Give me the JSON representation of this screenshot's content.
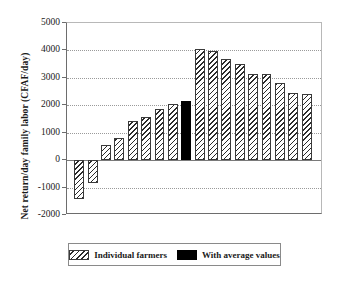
{
  "chart_data": {
    "type": "bar",
    "title": "",
    "xlabel": "",
    "ylabel": "Net return/day family labor (CFAF/day)",
    "ylim": [
      -2000,
      5000
    ],
    "yticks": [
      5000,
      4000,
      3000,
      2000,
      1000,
      0,
      -1000,
      -2000
    ],
    "ytick_labels": [
      "5000",
      "4000",
      "3000",
      "2000",
      "1000",
      "0",
      "-1000",
      "-2000"
    ],
    "grid": true,
    "grid_axis": "y",
    "legend_position": "bottom",
    "categories": [
      "1",
      "2",
      "3",
      "4",
      "5",
      "6",
      "7",
      "8",
      "9",
      "10",
      "11",
      "12",
      "13",
      "14",
      "15",
      "16",
      "17",
      "18"
    ],
    "values": [
      -1400,
      -830,
      550,
      790,
      1420,
      1570,
      1860,
      2060,
      2170,
      4070,
      3970,
      3670,
      3490,
      3130,
      3130,
      2810,
      2430,
      2400
    ],
    "series": [
      {
        "name": "Individual farmers",
        "fill": "hatched",
        "color": "#2b2b2b",
        "values": [
          -1400,
          -830,
          550,
          790,
          1420,
          1570,
          1860,
          2060,
          null,
          4070,
          3970,
          3670,
          3490,
          3130,
          3130,
          2810,
          2430,
          2400
        ]
      },
      {
        "name": "With average values",
        "fill": "solid",
        "color": "#000000",
        "values": [
          null,
          null,
          null,
          null,
          null,
          null,
          null,
          null,
          2170,
          null,
          null,
          null,
          null,
          null,
          null,
          null,
          null,
          null
        ]
      }
    ],
    "bars": [
      {
        "index": 0,
        "value": -1400,
        "series": "Individual farmers"
      },
      {
        "index": 1,
        "value": -830,
        "series": "Individual farmers"
      },
      {
        "index": 2,
        "value": 550,
        "series": "Individual farmers"
      },
      {
        "index": 3,
        "value": 790,
        "series": "Individual farmers"
      },
      {
        "index": 4,
        "value": 1420,
        "series": "Individual farmers"
      },
      {
        "index": 5,
        "value": 1570,
        "series": "Individual farmers"
      },
      {
        "index": 6,
        "value": 1860,
        "series": "Individual farmers"
      },
      {
        "index": 7,
        "value": 2060,
        "series": "Individual farmers"
      },
      {
        "index": 8,
        "value": 2170,
        "series": "With average values"
      },
      {
        "index": 9,
        "value": 4070,
        "series": "Individual farmers"
      },
      {
        "index": 10,
        "value": 3970,
        "series": "Individual farmers"
      },
      {
        "index": 11,
        "value": 3670,
        "series": "Individual farmers"
      },
      {
        "index": 12,
        "value": 3490,
        "series": "Individual farmers"
      },
      {
        "index": 13,
        "value": 3130,
        "series": "Individual farmers"
      },
      {
        "index": 14,
        "value": 3130,
        "series": "Individual farmers"
      },
      {
        "index": 15,
        "value": 2810,
        "series": "Individual farmers"
      },
      {
        "index": 16,
        "value": 2430,
        "series": "Individual farmers"
      },
      {
        "index": 17,
        "value": 2400,
        "series": "Individual farmers"
      }
    ]
  },
  "legend": {
    "entries": [
      {
        "label": "Individual farmers",
        "fill": "hatched"
      },
      {
        "label": "With average values",
        "fill": "solid"
      }
    ]
  }
}
